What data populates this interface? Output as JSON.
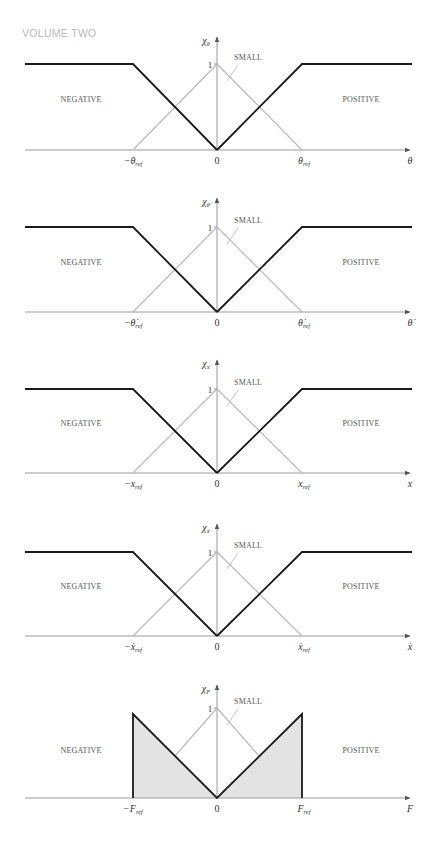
{
  "header": {
    "running_head": "VOLUME TWO"
  },
  "colors": {
    "membership_line": "#1a1a1a",
    "small_line": "#bdbdbd",
    "axis": "#9a9a9a",
    "fill": "#e3e3e3",
    "text": "#333333"
  },
  "chart_data": [
    {
      "type": "line",
      "title": "Membership functions for theta",
      "ylabel": "χ_θ",
      "xlabel": "θ",
      "x_ticks": [
        "−θ_ref",
        "0",
        "θ_ref"
      ],
      "y_ticks": [
        "1"
      ],
      "ylim": [
        0,
        1
      ],
      "series": [
        {
          "name": "NEGATIVE",
          "x": [
            -2,
            -1,
            0
          ],
          "values": [
            1,
            1,
            0
          ],
          "shape": "saturating-left"
        },
        {
          "name": "SMALL",
          "x": [
            -2,
            -1,
            0,
            1,
            2
          ],
          "values": [
            0,
            0,
            1,
            0,
            0
          ],
          "shape": "triangle"
        },
        {
          "name": "POSITIVE",
          "x": [
            0,
            1,
            2
          ],
          "values": [
            0,
            1,
            1
          ],
          "shape": "saturating-right"
        }
      ],
      "annotations": [
        "NEGATIVE",
        "SMALL",
        "POSITIVE"
      ]
    },
    {
      "type": "line",
      "title": "Membership functions for theta-dot",
      "ylabel": "χ_θ̇",
      "xlabel": "θ̇",
      "x_ticks": [
        "−θ̇_ref",
        "0",
        "θ̇_ref"
      ],
      "y_ticks": [
        "1"
      ],
      "ylim": [
        0,
        1
      ],
      "series": [
        {
          "name": "NEGATIVE",
          "x": [
            -2,
            -1,
            0
          ],
          "values": [
            1,
            1,
            0
          ]
        },
        {
          "name": "SMALL",
          "x": [
            -2,
            -1,
            0,
            1,
            2
          ],
          "values": [
            0,
            0,
            1,
            0,
            0
          ]
        },
        {
          "name": "POSITIVE",
          "x": [
            0,
            1,
            2
          ],
          "values": [
            0,
            1,
            1
          ]
        }
      ],
      "annotations": [
        "NEGATIVE",
        "SMALL",
        "POSITIVE"
      ]
    },
    {
      "type": "line",
      "title": "Membership functions for x",
      "ylabel": "χ_x",
      "xlabel": "x",
      "x_ticks": [
        "−x_ref",
        "0",
        "x_ref"
      ],
      "y_ticks": [
        "1"
      ],
      "ylim": [
        0,
        1
      ],
      "series": [
        {
          "name": "NEGATIVE",
          "x": [
            -2,
            -1,
            0
          ],
          "values": [
            1,
            1,
            0
          ]
        },
        {
          "name": "SMALL",
          "x": [
            -2,
            -1,
            0,
            1,
            2
          ],
          "values": [
            0,
            0,
            1,
            0,
            0
          ]
        },
        {
          "name": "POSITIVE",
          "x": [
            0,
            1,
            2
          ],
          "values": [
            0,
            1,
            1
          ]
        }
      ],
      "annotations": [
        "NEGATIVE",
        "SMALL",
        "POSITIVE"
      ]
    },
    {
      "type": "line",
      "title": "Membership functions for x-dot",
      "ylabel": "χ_ẋ",
      "xlabel": "ẋ",
      "x_ticks": [
        "−ẋ_ref",
        "0",
        "ẋ_ref"
      ],
      "y_ticks": [
        "1"
      ],
      "ylim": [
        0,
        1
      ],
      "series": [
        {
          "name": "NEGATIVE",
          "x": [
            -2,
            -1,
            0
          ],
          "values": [
            1,
            1,
            0
          ]
        },
        {
          "name": "SMALL",
          "x": [
            -2,
            -1,
            0,
            1,
            2
          ],
          "values": [
            0,
            0,
            1,
            0,
            0
          ]
        },
        {
          "name": "POSITIVE",
          "x": [
            0,
            1,
            2
          ],
          "values": [
            0,
            1,
            1
          ]
        }
      ],
      "annotations": [
        "NEGATIVE",
        "SMALL",
        "POSITIVE"
      ]
    },
    {
      "type": "area",
      "title": "Membership functions for F",
      "ylabel": "χ_F",
      "xlabel": "F",
      "x_ticks": [
        "−F_ref",
        "0",
        "F_ref"
      ],
      "y_ticks": [
        "1"
      ],
      "ylim": [
        0,
        1
      ],
      "series": [
        {
          "name": "NEGATIVE",
          "x": [
            -1,
            -1,
            0
          ],
          "values": [
            0,
            1,
            0
          ],
          "filled": true
        },
        {
          "name": "SMALL",
          "x": [
            -1,
            0,
            1
          ],
          "values": [
            0,
            1,
            0
          ]
        },
        {
          "name": "POSITIVE",
          "x": [
            0,
            1,
            1
          ],
          "values": [
            0,
            1,
            0
          ],
          "filled": true
        }
      ],
      "annotations": [
        "NEGATIVE",
        "SMALL",
        "POSITIVE"
      ]
    }
  ],
  "panels": [
    {
      "y_axis": "χ",
      "y_sub": "θ",
      "y_dot": false,
      "x_var": "θ",
      "x_dot": false,
      "neg_tick": "−θ",
      "pos_tick": "θ",
      "ref_sub": "ref",
      "zero": "0",
      "one": "1",
      "neg": "NEGATIVE",
      "small": "SMALL",
      "pos": "POSITIVE"
    },
    {
      "y_axis": "χ",
      "y_sub": "θ̇",
      "y_dot": true,
      "x_var": "θ̇",
      "x_dot": true,
      "neg_tick": "−θ̇",
      "pos_tick": "θ̇",
      "ref_sub": "ref",
      "zero": "0",
      "one": "1",
      "neg": "NEGATIVE",
      "small": "SMALL",
      "pos": "POSITIVE"
    },
    {
      "y_axis": "χ",
      "y_sub": "x",
      "y_dot": false,
      "x_var": "x",
      "x_dot": false,
      "neg_tick": "−x",
      "pos_tick": "x",
      "ref_sub": "ref",
      "zero": "0",
      "one": "1",
      "neg": "NEGATIVE",
      "small": "SMALL",
      "pos": "POSITIVE"
    },
    {
      "y_axis": "χ",
      "y_sub": "ẋ",
      "y_dot": true,
      "x_var": "ẋ",
      "x_dot": true,
      "neg_tick": "−ẋ",
      "pos_tick": "ẋ",
      "ref_sub": "ref",
      "zero": "0",
      "one": "1",
      "neg": "NEGATIVE",
      "small": "SMALL",
      "pos": "POSITIVE"
    },
    {
      "y_axis": "χ",
      "y_sub": "F",
      "y_dot": false,
      "x_var": "F",
      "x_dot": false,
      "neg_tick": "−F",
      "pos_tick": "F",
      "ref_sub": "ref",
      "zero": "0",
      "one": "1",
      "neg": "NEGATIVE",
      "small": "SMALL",
      "pos": "POSITIVE"
    }
  ]
}
